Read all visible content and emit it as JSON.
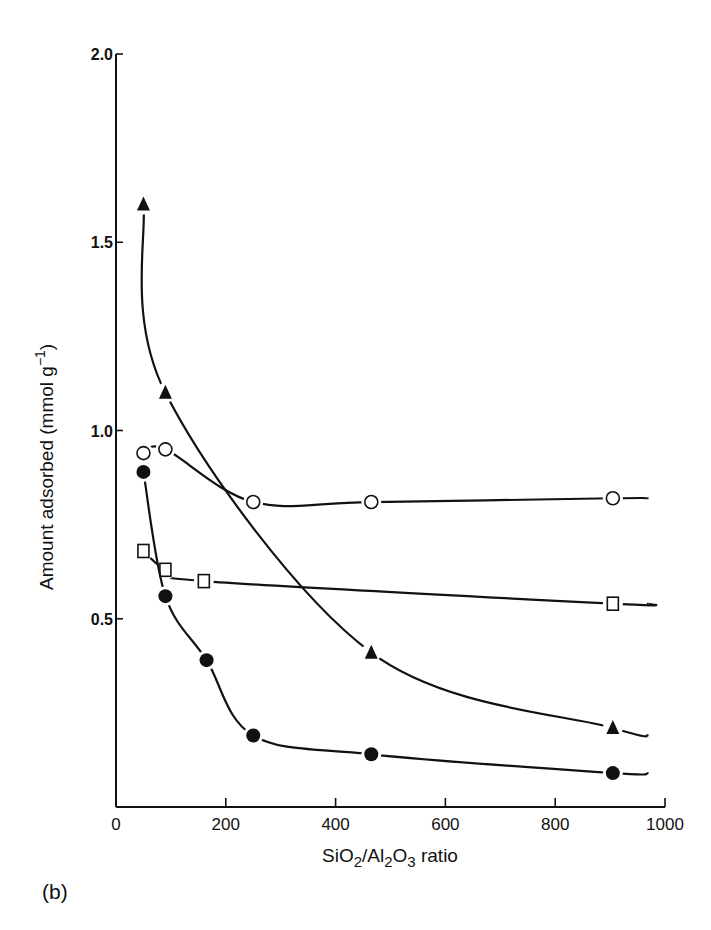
{
  "chart_data": {
    "type": "scatter",
    "title": "",
    "panel_label": "(b)",
    "xlabel": "SiO2/Al2O3 ratio",
    "xlabel_parts": {
      "a": "SiO",
      "b": "2",
      "c": "/Al",
      "d": "2",
      "e": "O",
      "f": "3",
      "g": " ratio"
    },
    "ylabel": "Amount adsorbed (mmol g-1)",
    "ylabel_parts": {
      "a": "Amount adsorbed  (mmol g",
      "b": "−1",
      "c": ")"
    },
    "xlim": [
      0,
      1000
    ],
    "ylim": [
      0,
      2.0
    ],
    "xticks": [
      0,
      200,
      400,
      600,
      800,
      1000
    ],
    "xtick_labels": [
      "0",
      "200",
      "400",
      "600",
      "800",
      "1000"
    ],
    "yticks": [
      0.5,
      1.0,
      1.5,
      2.0
    ],
    "ytick_labels": [
      "0.5",
      "1.0",
      "1.5",
      "2.0"
    ],
    "grid": false,
    "legend": null,
    "series": [
      {
        "name": "filled-triangle",
        "marker": "triangle-filled",
        "x": [
          50,
          90,
          465,
          905
        ],
        "y": [
          1.6,
          1.1,
          0.41,
          0.21
        ],
        "curve_end": [
          970,
          0.19
        ]
      },
      {
        "name": "open-circle",
        "marker": "circle-open",
        "x": [
          50,
          90,
          250,
          465,
          905
        ],
        "y": [
          0.94,
          0.95,
          0.81,
          0.81,
          0.82
        ],
        "curve_end": [
          970,
          0.82
        ]
      },
      {
        "name": "open-square",
        "marker": "square-open",
        "x": [
          50,
          90,
          160,
          905
        ],
        "y": [
          0.68,
          0.63,
          0.6,
          0.54
        ],
        "curve_end": [
          970,
          0.54
        ]
      },
      {
        "name": "filled-circle",
        "marker": "circle-filled",
        "x": [
          50,
          90,
          165,
          250,
          465,
          905
        ],
        "y": [
          0.89,
          0.56,
          0.39,
          0.19,
          0.14,
          0.09
        ],
        "curve_end": [
          970,
          0.09
        ]
      }
    ]
  },
  "colors": {
    "ink": "#111111",
    "background": "#ffffff"
  }
}
